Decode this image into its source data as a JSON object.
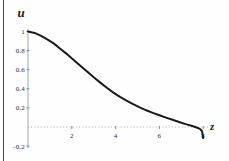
{
  "page": {
    "background": "#fefefe",
    "scan_border_color": "#474747"
  },
  "chart_data": {
    "type": "line",
    "title": "",
    "xlabel": "z",
    "ylabel": "u",
    "xlim": [
      0,
      8.3
    ],
    "ylim": [
      -0.28,
      1.05
    ],
    "grid": false,
    "legend_position": "none",
    "axis_color": "#9b9b9b",
    "x_axis_style": "dotted",
    "tick_color": "#6f6f6f",
    "tick_text_color": "#2e2e2e",
    "curve_color": "#1b1b1b",
    "x_ticks": [
      2,
      4,
      6,
      8
    ],
    "x_tick_labels": [
      "2",
      "4",
      "6",
      "8"
    ],
    "y_ticks": [
      1,
      0.8,
      0.6,
      0.4,
      0.2,
      -0.2
    ],
    "y_tick_labels": [
      "1",
      "0.8",
      "0.6",
      "0.4",
      "0.2",
      "-0.2"
    ],
    "series": [
      {
        "name": "u(z)",
        "points": [
          [
            0,
            1.0
          ],
          [
            0.3,
            0.985
          ],
          [
            0.6,
            0.955
          ],
          [
            0.9,
            0.915
          ],
          [
            1.2,
            0.87
          ],
          [
            1.5,
            0.815
          ],
          [
            1.8,
            0.76
          ],
          [
            2.1,
            0.7
          ],
          [
            2.4,
            0.64
          ],
          [
            2.7,
            0.58
          ],
          [
            3.0,
            0.52
          ],
          [
            3.3,
            0.465
          ],
          [
            3.6,
            0.41
          ],
          [
            3.9,
            0.36
          ],
          [
            4.2,
            0.315
          ],
          [
            4.5,
            0.275
          ],
          [
            4.8,
            0.24
          ],
          [
            5.1,
            0.205
          ],
          [
            5.4,
            0.175
          ],
          [
            5.7,
            0.148
          ],
          [
            6.0,
            0.122
          ],
          [
            6.3,
            0.098
          ],
          [
            6.6,
            0.075
          ],
          [
            6.9,
            0.052
          ],
          [
            7.2,
            0.03
          ],
          [
            7.5,
            0.01
          ],
          [
            7.7,
            -0.005
          ],
          [
            7.85,
            -0.02
          ],
          [
            7.95,
            -0.045
          ],
          [
            8.0,
            -0.115
          ]
        ]
      }
    ]
  }
}
